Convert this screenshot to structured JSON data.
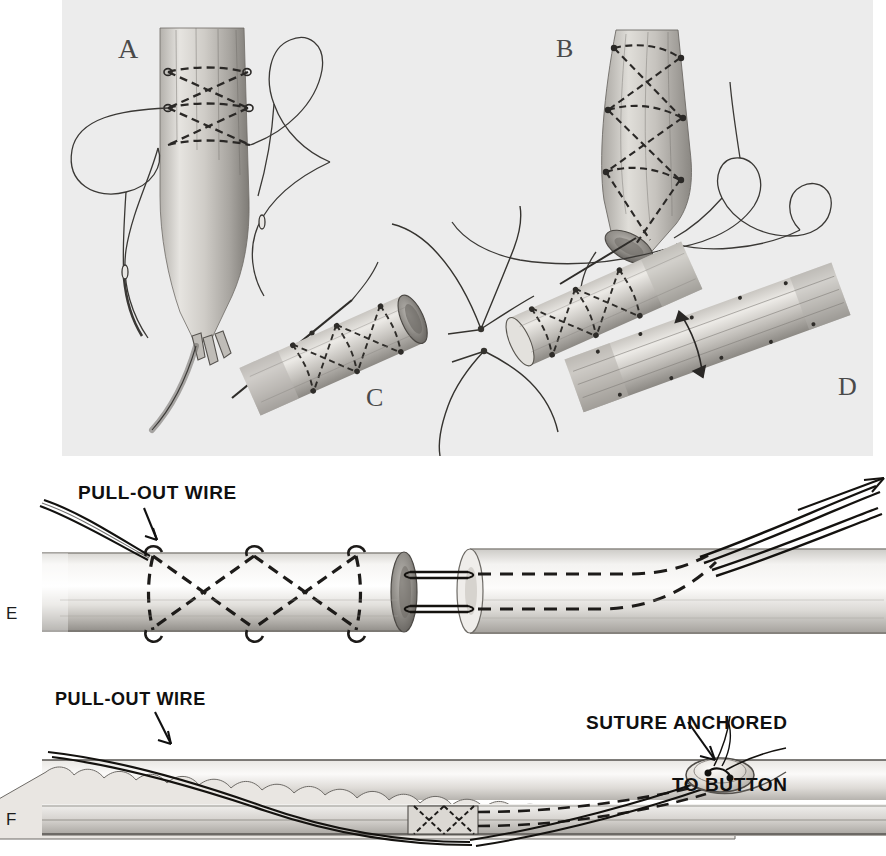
{
  "figure": {
    "width": 886,
    "height": 856,
    "background_color": "#ffffff",
    "top_plate_color": "#ececec"
  },
  "panels": [
    {
      "id": "A",
      "letter": "A",
      "description": "Tendon end with criss-cross suture placed, two needles with loops of suture trailing",
      "x": 118,
      "y": 33,
      "font_size": 28
    },
    {
      "id": "B",
      "letter": "B",
      "description": "Tendon stump with spiral criss-cross suture wrapped around, needles and suture loops",
      "x": 556,
      "y": 34,
      "font_size": 26
    },
    {
      "id": "C",
      "letter": "C",
      "description": "Two sutured tendon ends drawn together by suture strands",
      "x": 366,
      "y": 383,
      "font_size": 26
    },
    {
      "id": "D",
      "letter": "D",
      "description": "Completed tendon anastomosis with suture knot",
      "x": 838,
      "y": 372,
      "font_size": 26
    },
    {
      "id": "E",
      "letter": "E",
      "description": "Longitudinal section of tendon repair showing pull-out wire exiting distally",
      "x": 8,
      "y": 604,
      "font_size": 17
    },
    {
      "id": "F",
      "letter": "F",
      "description": "Tendon within sheath, pull-out wire and suture anchored to external button",
      "x": 8,
      "y": 810,
      "font_size": 17
    }
  ],
  "callouts": [
    {
      "id": "pull-out-wire-e",
      "text": "PULL-OUT WIRE",
      "x": 78,
      "y": 483,
      "font_size": 19,
      "align": "left",
      "panel": "E"
    },
    {
      "id": "pull-out-wire-f",
      "text": "PULL-OUT WIRE",
      "x": 55,
      "y": 700,
      "font_size": 18,
      "align": "left",
      "panel": "F"
    },
    {
      "id": "suture-anchored-to-button",
      "text": "SUTURE ANCHORED\nTO BUTTON",
      "line1": "SUTURE ANCHORED",
      "line2": "TO BUTTON",
      "x": 586,
      "y": 676,
      "font_size": 19,
      "align": "left",
      "panel": "F"
    }
  ],
  "colors": {
    "ink": "#101010",
    "tissue_light": "#f3f2f0",
    "tissue_mid": "#cfcdc9",
    "tissue_dark": "#8d8a86",
    "plate_gray": "#ececec",
    "letter_gray": "#4a4a4a"
  }
}
